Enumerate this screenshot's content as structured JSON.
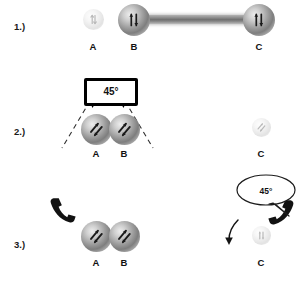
{
  "figure": {
    "background_color": "#ffffff",
    "ink_color": "#111111",
    "node_color": "#9a9a9a",
    "bond_color": "#7f7f7f"
  },
  "rows": [
    {
      "number": "1.)",
      "nodes": [
        {
          "label": "A",
          "state": "faded",
          "spin": "vertical-double-arrow"
        },
        {
          "label": "B",
          "state": "active",
          "spin": "vertical-double-arrow"
        },
        {
          "label": "C",
          "state": "active",
          "spin": "vertical-double-arrow"
        }
      ],
      "bond": {
        "from": "B",
        "to": "C",
        "style": "long-rod"
      },
      "annotations": []
    },
    {
      "number": "2.)",
      "nodes": [
        {
          "label": "A",
          "state": "active",
          "spin": "tilted-double-arrow"
        },
        {
          "label": "B",
          "state": "active",
          "spin": "tilted-double-arrow"
        },
        {
          "label": "C",
          "state": "faded",
          "spin": "tilted-double-arrow"
        }
      ],
      "bond": {
        "from": "A",
        "to": "B",
        "style": "short-rod"
      },
      "annotations": [
        {
          "type": "measurement-box",
          "text": "45°"
        },
        {
          "type": "dashed-angle-lines",
          "count": 2
        }
      ]
    },
    {
      "number": "3.)",
      "nodes": [
        {
          "label": "A",
          "state": "active",
          "spin": "tilted-double-arrow"
        },
        {
          "label": "B",
          "state": "active",
          "spin": "tilted-double-arrow"
        },
        {
          "label": "C",
          "state": "faded",
          "spin": "vertical-double-arrow"
        }
      ],
      "bond": {
        "from": "A",
        "to": "B",
        "style": "short-rod"
      },
      "annotations": [
        {
          "type": "speech-bubble",
          "text": "45°"
        },
        {
          "type": "telephone-handset",
          "side": "left"
        },
        {
          "type": "telephone-handset",
          "side": "right"
        },
        {
          "type": "curved-arrow",
          "target": "C"
        }
      ]
    }
  ],
  "labels": {
    "a": "A",
    "b": "B",
    "c": "C",
    "angle": "45°",
    "row1": "1.)",
    "row2": "2.)",
    "row3": "3.)"
  }
}
